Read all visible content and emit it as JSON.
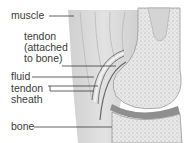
{
  "diagram": {
    "labels": {
      "muscle": "muscle",
      "tendon": "tendon\n(attached\nto bone)",
      "fluid": "fluid",
      "tendon_sheath": "tendon\nsheath",
      "bone": "bone"
    },
    "colors": {
      "background": "#ffffff",
      "muscle": "#d9d9d9",
      "bone": "#e6e6e6",
      "bone_texture": "#bdbdbd",
      "cartilage": "#8f8f8f",
      "leader_line": "#3a3a3a",
      "text": "#3a3a3a"
    }
  }
}
